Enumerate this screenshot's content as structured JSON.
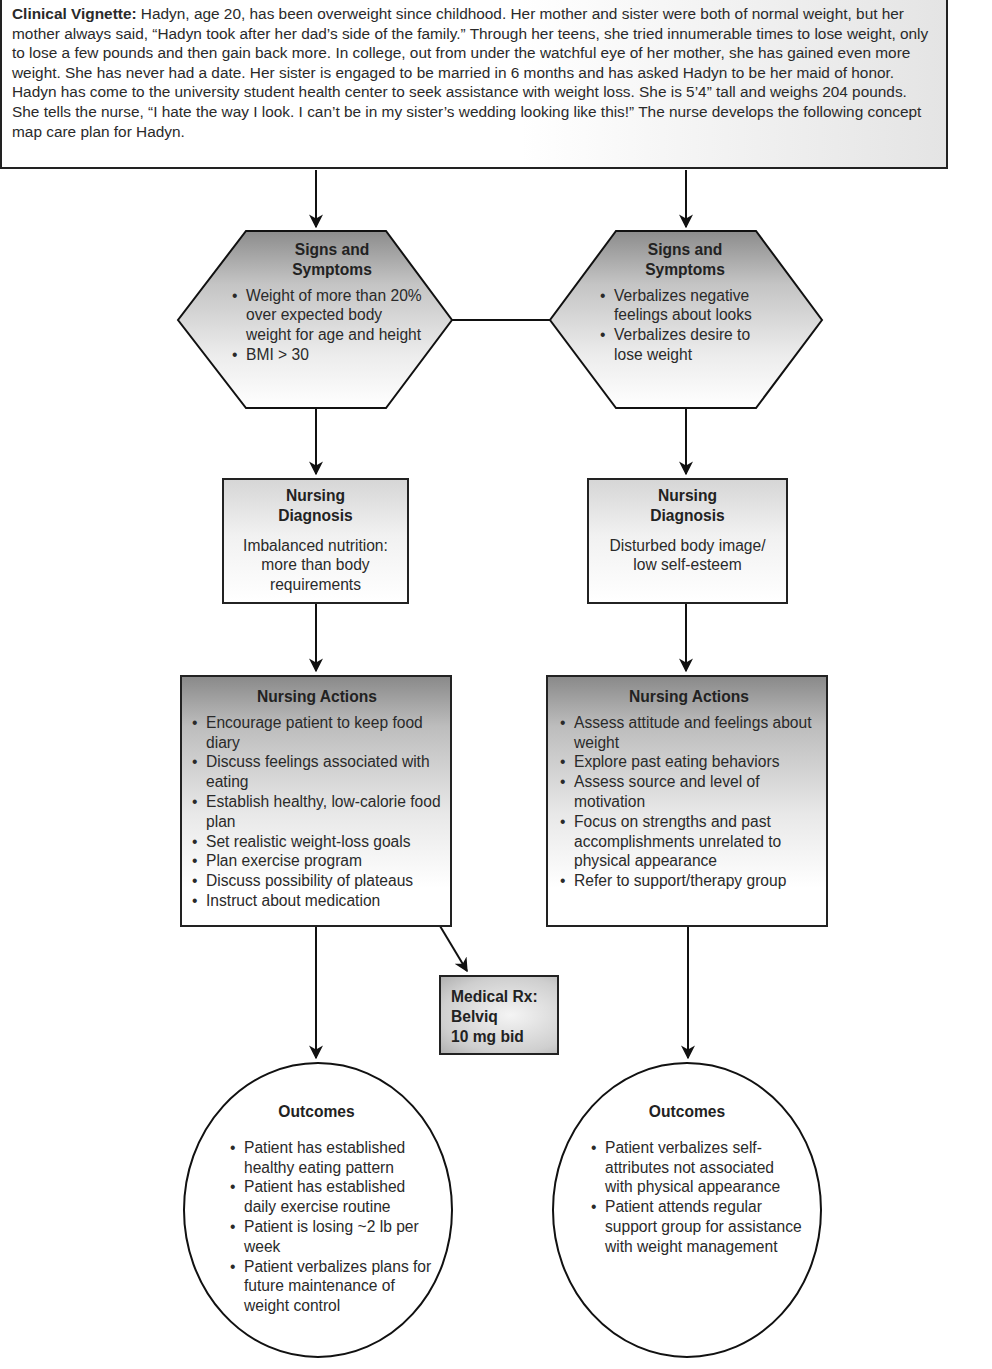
{
  "vignette": {
    "lead": "Clinical Vignette:",
    "text": " Hadyn, age 20, has been overweight since childhood. Her mother and sister were both of normal weight, but her mother always said, “Hadyn took after her dad’s side of the family.” Through her teens, she tried innumerable times to lose weight, only to lose a few pounds and then gain back more. In college, out from under the watchful eye of her mother, she has gained even more weight. She has never had a date. Her sister is engaged to be married in 6 months and has asked Hadyn to be her maid of honor. Hadyn has come to the university student health center to seek assistance with weight loss. She is 5’4” tall and weighs 204 pounds. She tells the nurse, “I hate the way I look. I can’t be in my sister’s wedding looking like this!” The nurse develops the following concept map care plan for Hadyn."
  },
  "left": {
    "signs": {
      "title_l1": "Signs and",
      "title_l2": "Symptoms",
      "items": [
        "Weight of more than 20% over expected body weight for age and height",
        "BMI > 30"
      ]
    },
    "diagnosis": {
      "title_l1": "Nursing",
      "title_l2": "Diagnosis",
      "text": "Imbalanced nutrition: more than body requirements"
    },
    "actions": {
      "title": "Nursing Actions",
      "items": [
        "Encourage patient to keep food diary",
        "Discuss feelings associated with eating",
        "Establish healthy, low-calorie food plan",
        "Set realistic weight-loss goals",
        "Plan exercise program",
        "Discuss possibility of plateaus",
        "Instruct about medication"
      ]
    },
    "outcomes": {
      "title": "Outcomes",
      "items": [
        "Patient has established healthy eating pattern",
        "Patient has established daily exercise routine",
        "Patient is losing ~2 lb per week",
        "Patient verbalizes plans for future maintenance of weight control"
      ]
    }
  },
  "medical_rx": {
    "l1": "Medical Rx:",
    "l2": "Belviq",
    "l3": "10 mg bid"
  },
  "right": {
    "signs": {
      "title_l1": "Signs and",
      "title_l2": "Symptoms",
      "items": [
        "Verbalizes negative feelings about looks",
        "Verbalizes desire to lose weight"
      ]
    },
    "diagnosis": {
      "title_l1": "Nursing",
      "title_l2": "Diagnosis",
      "text": "Disturbed body image/ low self-esteem"
    },
    "actions": {
      "title": "Nursing Actions",
      "items": [
        "Assess attitude and feelings about weight",
        "Explore past eating behaviors",
        "Assess source and level of motivation",
        "Focus on strengths and past accomplishments unrelated to physical appearance",
        "Refer to support/therapy group"
      ]
    },
    "outcomes": {
      "title": "Outcomes",
      "items": [
        "Patient verbalizes self-attributes not associated with physical appearance",
        "Patient attends regular support group for assistance with weight management"
      ]
    }
  },
  "colors": {
    "stroke": "#222222",
    "fill_dark": "#8a8a8a",
    "fill_light": "#ffffff"
  }
}
